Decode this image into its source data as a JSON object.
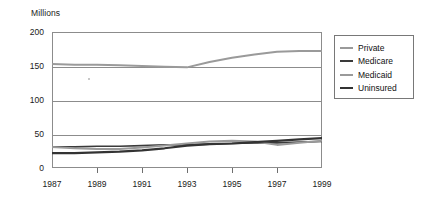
{
  "chart_data": {
    "type": "line",
    "title": "",
    "ylabel": "Millions",
    "xlabel": "",
    "ylim": [
      0,
      200
    ],
    "xlim": [
      1987,
      1999
    ],
    "grid": true,
    "legend_position": "right-outside",
    "ytick_labels": [
      "200",
      "150",
      "100",
      "50",
      "0"
    ],
    "ytick_values": [
      200,
      150,
      100,
      50,
      0
    ],
    "xtick_labels": [
      "1987",
      "1989",
      "1991",
      "1993",
      "1995",
      "1997",
      "1999"
    ],
    "xtick_values": [
      1987,
      1989,
      1991,
      1993,
      1995,
      1997,
      1999
    ],
    "x": [
      1987,
      1988,
      1989,
      1990,
      1991,
      1992,
      1993,
      1994,
      1995,
      1996,
      1997,
      1998,
      1999
    ],
    "series": [
      {
        "name": "Private",
        "color": "#9a9a9a",
        "width": 2.0,
        "values": [
          153,
          152,
          152,
          151,
          150,
          149,
          148,
          156,
          162,
          167,
          171,
          172,
          172
        ]
      },
      {
        "name": "Medicare",
        "color": "#3a3a3a",
        "width": 1.7,
        "values": [
          31,
          31,
          32,
          32,
          33,
          34,
          34,
          35,
          36,
          37,
          37,
          38,
          39
        ]
      },
      {
        "name": "Medicaid",
        "color": "#9a9a9a",
        "width": 2.0,
        "values": [
          31,
          29,
          28,
          28,
          30,
          33,
          36,
          39,
          40,
          39,
          34,
          37,
          40
        ]
      },
      {
        "name": "Uninsured",
        "color": "#333333",
        "width": 2.2,
        "values": [
          22,
          22,
          23,
          24,
          26,
          29,
          33,
          35,
          36,
          38,
          40,
          42,
          44
        ]
      }
    ]
  }
}
